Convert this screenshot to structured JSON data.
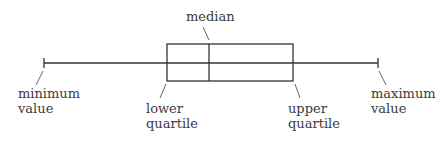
{
  "diagram": {
    "type": "box-and-whisker",
    "colors": {
      "stroke": "#333333",
      "text": "#3a3a3a",
      "background": "#ffffff"
    },
    "labels": {
      "median": "median",
      "minimum": [
        "minimum",
        "value"
      ],
      "lower_quartile": [
        "lower",
        "quartile"
      ],
      "upper_quartile": [
        "upper",
        "quartile"
      ],
      "maximum": [
        "maximum",
        "value"
      ]
    }
  }
}
